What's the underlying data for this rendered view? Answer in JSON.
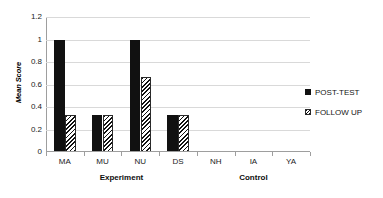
{
  "chart_data": {
    "type": "bar",
    "title": "",
    "subtitle": "",
    "xlabel": "",
    "ylabel": "Mean Score",
    "categories": [
      "MA",
      "MU",
      "NU",
      "DS",
      "NH",
      "IA",
      "YA"
    ],
    "series": [
      {
        "name": "POST-TEST",
        "values": [
          1.0,
          0.33,
          1.0,
          0.33,
          0,
          0,
          0
        ]
      },
      {
        "name": "FOLLOW UP",
        "values": [
          0.33,
          0.33,
          0.67,
          0.33,
          0,
          0,
          0
        ]
      }
    ],
    "ylim": [
      0,
      1.2
    ],
    "ytick_labels": [
      "0",
      "0.2",
      "0.4",
      "0.6",
      "0.8",
      "1",
      "1.2"
    ],
    "ytick_values": [
      0,
      0.2,
      0.4,
      0.6,
      0.8,
      1,
      1.2
    ],
    "grid": "horizontal",
    "legend_position": "right",
    "group_labels": [
      {
        "label": "Experiment",
        "categories": [
          "MA",
          "MU",
          "NU",
          "DS"
        ]
      },
      {
        "label": "Control",
        "categories": [
          "NH",
          "IA",
          "YA"
        ]
      }
    ],
    "colors": {
      "post_test": "#111111",
      "follow_up_hatch": "#111111",
      "follow_up_background": "#ffffff",
      "gridline": "#d9d9d9",
      "axis": "#9e9e9e",
      "plot_background": "#ffffff"
    }
  },
  "legend": {
    "items": [
      {
        "label": "POST-TEST",
        "marker": "solid-square-marker"
      },
      {
        "label": "FOLLOW UP",
        "marker": "hatched-square-marker"
      }
    ]
  }
}
